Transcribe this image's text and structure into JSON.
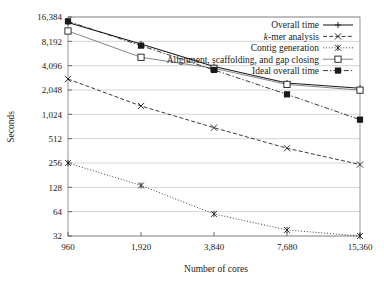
{
  "chart_data": {
    "type": "line",
    "title": "",
    "xlabel": "Number of cores",
    "ylabel": "Seconds",
    "x": [
      960,
      1920,
      3840,
      7680,
      15360
    ],
    "xtick_labels": [
      "960",
      "1,920",
      "3,840",
      "7,680",
      "15,360"
    ],
    "ytick_labels": [
      "32",
      "64",
      "128",
      "256",
      "512",
      "1,024",
      "2,048",
      "4,096",
      "8,192",
      "16,384"
    ],
    "ytick_values": [
      32,
      64,
      128,
      256,
      512,
      1024,
      2048,
      4096,
      8192,
      16384
    ],
    "yscale": "log2",
    "ylim": [
      32,
      16384
    ],
    "grid": true,
    "legend_position": "top-right",
    "series": [
      {
        "name": "Overall time",
        "marker": "plus",
        "line": "solid",
        "values": [
          14000,
          7600,
          4000,
          2500,
          2150
        ]
      },
      {
        "name": "k-mer analysis",
        "marker": "cross",
        "line": "dashed",
        "values": [
          2800,
          1300,
          700,
          390,
          245
        ]
      },
      {
        "name": "Contig generation",
        "marker": "asterisk",
        "line": "dotted",
        "values": [
          256,
          135,
          60,
          38,
          32
        ]
      },
      {
        "name": "Alignment, scaffolding, and gap closing",
        "marker": "open-square",
        "line": "solid-light",
        "values": [
          11000,
          5200,
          3800,
          2400,
          2040
        ]
      },
      {
        "name": "Ideal overall time",
        "marker": "filled-square",
        "line": "dash-dot",
        "values": [
          14500,
          7250,
          3625,
          1810,
          880
        ]
      }
    ]
  },
  "legend": {
    "items": [
      {
        "label": "Overall time",
        "label_italic_prefix": ""
      },
      {
        "label": "-mer analysis",
        "label_italic_prefix": "k"
      },
      {
        "label": "Contig generation",
        "label_italic_prefix": ""
      },
      {
        "label": "Alignment, scaffolding, and gap closing",
        "label_italic_prefix": ""
      },
      {
        "label": "Ideal overall time",
        "label_italic_prefix": ""
      }
    ]
  },
  "colors": {
    "ink": "#1a1a1a",
    "grid": "#b9b9b9",
    "frame": "#8a8a8a",
    "light_line": "#707070"
  }
}
